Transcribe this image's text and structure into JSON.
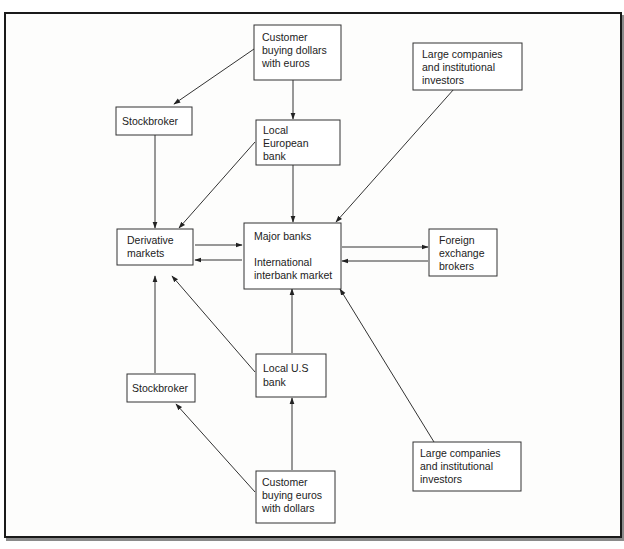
{
  "diagram": {
    "nodes": {
      "customer_dollars": {
        "lines": [
          "Customer",
          "buying dollars",
          "with euros"
        ]
      },
      "large_top": {
        "lines": [
          "Large companies",
          "and institutional",
          "investors"
        ]
      },
      "stockbroker_top": {
        "lines": [
          "Stockbroker"
        ]
      },
      "local_european": {
        "lines": [
          "Local",
          "European",
          "bank"
        ]
      },
      "derivative": {
        "lines": [
          "Derivative",
          "markets"
        ]
      },
      "major_banks": {
        "lines": [
          "Major banks",
          "",
          "International",
          "interbank market"
        ]
      },
      "fx_brokers": {
        "lines": [
          "Foreign",
          "exchange",
          "brokers"
        ]
      },
      "local_us": {
        "lines": [
          "Local U.S",
          "bank"
        ]
      },
      "stockbroker_bottom": {
        "lines": [
          "Stockbroker"
        ]
      },
      "large_bottom": {
        "lines": [
          "Large companies",
          "and institutional",
          "investors"
        ]
      },
      "customer_euros": {
        "lines": [
          "Customer",
          "buying euros",
          "with dollars"
        ]
      }
    },
    "edges": [
      {
        "from": "Customer buying dollars with euros",
        "to": "Stockbroker (top)"
      },
      {
        "from": "Customer buying dollars with euros",
        "to": "Local European bank"
      },
      {
        "from": "Large companies and institutional investors (top)",
        "to": "Major banks"
      },
      {
        "from": "Stockbroker (top)",
        "to": "Derivative markets"
      },
      {
        "from": "Local European bank",
        "to": "Derivative markets"
      },
      {
        "from": "Local European bank",
        "to": "Major banks"
      },
      {
        "from": "Derivative markets",
        "to": "Major banks"
      },
      {
        "from": "Major banks",
        "to": "Derivative markets"
      },
      {
        "from": "Major banks",
        "to": "Foreign exchange brokers"
      },
      {
        "from": "Foreign exchange brokers",
        "to": "Major banks"
      },
      {
        "from": "Local U.S bank",
        "to": "Major banks"
      },
      {
        "from": "Local U.S bank",
        "to": "Derivative markets"
      },
      {
        "from": "Stockbroker (bottom)",
        "to": "Derivative markets"
      },
      {
        "from": "Customer buying euros with dollars",
        "to": "Stockbroker (bottom)"
      },
      {
        "from": "Customer buying euros with dollars",
        "to": "Local U.S bank"
      },
      {
        "from": "Large companies and institutional investors (bottom)",
        "to": "Major banks"
      }
    ]
  }
}
